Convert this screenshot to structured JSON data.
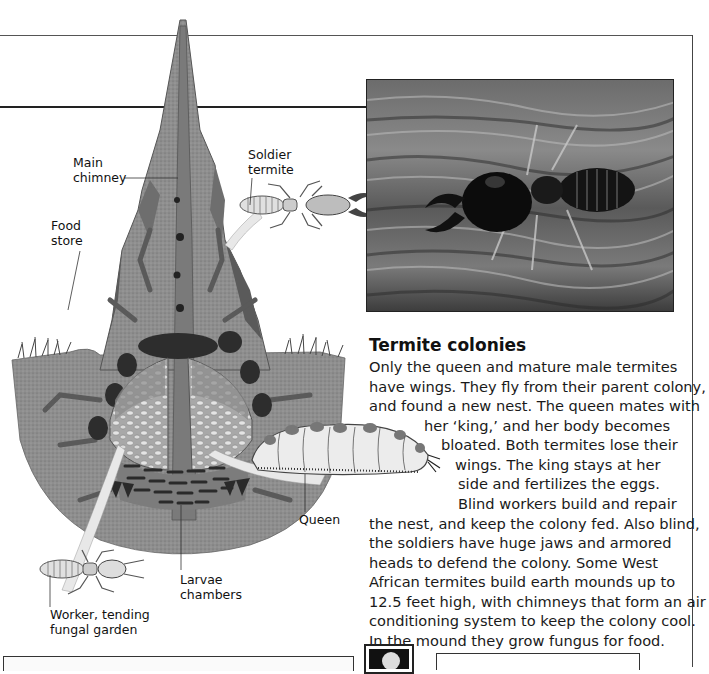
{
  "page": {
    "heading": "Termite colonies",
    "body_lines": [
      "Only the queen and mature male termites",
      "have wings. They fly from their parent colony,",
      "and found a new nest. The queen mates with",
      "her ‘king,’ and her body becomes",
      "bloated. Both termites lose their",
      "wings. The king stays at her",
      "side and fertilizes the eggs.",
      "Blind workers build and repair",
      "the nest, and keep the colony fed. Also blind,",
      "the soldiers have huge jaws and armored",
      "heads to defend the colony. Some West",
      "African termites build earth mounds up to",
      "12.5 feet high, with chimneys that form an air",
      "conditioning system to keep the colony cool.",
      "In the mound they grow fungus for food."
    ]
  },
  "diagram": {
    "labels": {
      "main_chimney": [
        "Main",
        "chimney"
      ],
      "soldier_termite": [
        "Soldier",
        "termite"
      ],
      "food_store": [
        "Food",
        "store"
      ],
      "queen": [
        "Queen"
      ],
      "larvae_chambers": [
        "Larvae",
        "chambers"
      ],
      "worker": [
        "Worker, tending",
        "fungal garden"
      ]
    }
  },
  "photo": {
    "subject": "soldier-termite-photo"
  },
  "colors": {
    "ink": "#1a1a1a",
    "mound_light": "#9a9a9a",
    "mound_dark": "#4a4a4a",
    "chamber": "#2a2a2a"
  }
}
